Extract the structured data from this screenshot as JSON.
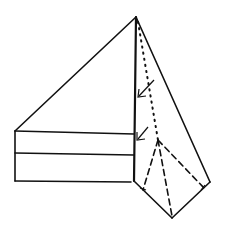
{
  "figure": {
    "title": "",
    "colors": {
      "ink": "#111111",
      "background": "#ffffff"
    },
    "shapes": {
      "apex": [
        136,
        17
      ],
      "left_triangle_base_left": [
        15,
        131
      ],
      "rectangle": {
        "left": 15,
        "top": 131,
        "middle": 153,
        "bottom": 181,
        "right": 133
      },
      "kite": {
        "right": [
          210,
          182
        ],
        "bottom": [
          172,
          218
        ],
        "left": [
          134,
          181
        ]
      },
      "dashed_apex": [
        158,
        140
      ],
      "arrows": [
        {
          "from": [
            154,
            80
          ],
          "to": [
            138,
            96
          ]
        },
        {
          "from": [
            148,
            127
          ],
          "to": [
            137,
            139
          ]
        }
      ]
    }
  }
}
